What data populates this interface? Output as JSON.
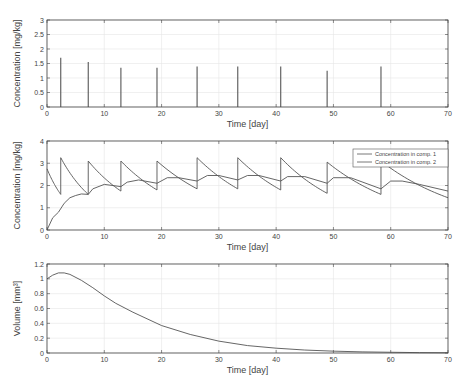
{
  "chart_data": [
    {
      "type": "line",
      "subtype": "impulse",
      "title": "",
      "xlabel": "Time [day]",
      "ylabel": "Concentration [mg/kg]",
      "xlim": [
        0,
        70
      ],
      "ylim": [
        0,
        3
      ],
      "xticks": [
        0,
        10,
        20,
        30,
        40,
        50,
        60,
        70
      ],
      "yticks": [
        0,
        0.5,
        1,
        1.5,
        2,
        2.5,
        3
      ],
      "ytick_labels": [
        "0",
        "0.5",
        "1",
        "1.5",
        "2",
        "2.5",
        "3"
      ],
      "grid": true,
      "series": [
        {
          "name": "Dose",
          "x": [
            2.4,
            7.2,
            12.9,
            19.2,
            26.2,
            33.3,
            40.8,
            48.9,
            58.3
          ],
          "values": [
            1.7,
            1.55,
            1.35,
            1.35,
            1.4,
            1.4,
            1.4,
            1.25,
            1.4
          ]
        }
      ]
    },
    {
      "type": "line",
      "title": "",
      "xlabel": "Time [day]",
      "ylabel": "Concentration [mg/kg]",
      "xlim": [
        0,
        70
      ],
      "ylim": [
        0,
        4
      ],
      "xticks": [
        0,
        10,
        20,
        30,
        40,
        50,
        60,
        70
      ],
      "yticks": [
        0,
        1,
        2,
        3,
        4
      ],
      "ytick_labels": [
        "0",
        "1",
        "2",
        "3",
        "4"
      ],
      "grid": true,
      "legend_position": "upper right",
      "series": [
        {
          "name": "Concentration in comp. 1",
          "x": [
            0,
            2.4,
            2.4,
            7.2,
            7.2,
            12.9,
            12.9,
            19.2,
            19.2,
            26.2,
            26.2,
            33.3,
            33.3,
            40.8,
            40.8,
            48.9,
            48.9,
            58.3,
            58.3,
            70
          ],
          "values": [
            2.75,
            1.6,
            3.25,
            1.6,
            3.1,
            1.75,
            3.1,
            1.8,
            3.1,
            1.85,
            3.25,
            1.85,
            3.25,
            1.8,
            3.25,
            1.65,
            3.05,
            1.6,
            3.1,
            1.45
          ],
          "decay": true
        },
        {
          "name": "Concentration in comp. 2",
          "x": [
            0,
            1,
            2,
            3,
            4,
            5,
            6,
            7.2,
            8,
            10,
            12.9,
            14,
            16,
            19.2,
            21,
            23,
            26.2,
            28,
            30,
            33.3,
            35,
            37,
            40.8,
            42,
            45,
            48.9,
            50,
            53,
            58.3,
            60,
            62,
            65,
            70
          ],
          "values": [
            0,
            0.55,
            0.8,
            1.2,
            1.45,
            1.55,
            1.62,
            1.6,
            1.85,
            2.05,
            1.95,
            2.15,
            2.25,
            2.1,
            2.35,
            2.35,
            2.2,
            2.45,
            2.45,
            2.25,
            2.45,
            2.45,
            2.2,
            2.4,
            2.4,
            2.1,
            2.35,
            2.35,
            1.85,
            2.2,
            2.2,
            2.05,
            1.75
          ]
        }
      ]
    },
    {
      "type": "line",
      "title": "",
      "xlabel": "Time [day]",
      "ylabel": "Volume [mm³]",
      "xlim": [
        0,
        70
      ],
      "ylim": [
        0,
        1.2
      ],
      "xticks": [
        0,
        10,
        20,
        30,
        40,
        50,
        60,
        70
      ],
      "yticks": [
        0,
        0.2,
        0.4,
        0.6,
        0.8,
        1,
        1.2
      ],
      "ytick_labels": [
        "0",
        "0.2",
        "0.4",
        "0.6",
        "0.8",
        "1",
        "1.2"
      ],
      "grid": true,
      "series": [
        {
          "name": "Volume",
          "x": [
            0,
            1,
            2,
            3,
            4,
            6,
            8,
            10,
            12,
            15,
            20,
            25,
            30,
            35,
            40,
            45,
            50,
            55,
            60,
            65,
            70
          ],
          "values": [
            1.0,
            1.05,
            1.08,
            1.08,
            1.06,
            0.98,
            0.88,
            0.77,
            0.67,
            0.55,
            0.37,
            0.25,
            0.16,
            0.1,
            0.065,
            0.04,
            0.025,
            0.015,
            0.01,
            0.005,
            0.003
          ]
        }
      ]
    }
  ],
  "labels": {
    "top_xlabel": "Time [day]",
    "top_ylabel": "Concentration [mg/kg]",
    "mid_xlabel": "Time [day]",
    "mid_ylabel": "Concentration [mg/kg]",
    "bottom_xlabel": "Time [day]",
    "bottom_ylabel": "Volume [mm³]",
    "legend_1": "Concentration in comp. 1",
    "legend_2": "Concentration in comp. 2"
  },
  "colors": {
    "line": "#555555",
    "axis": "#444444",
    "grid": "#e6e6e6"
  }
}
